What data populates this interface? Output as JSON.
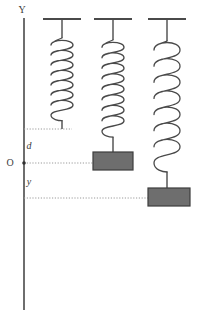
{
  "figure": {
    "background_color": "#ffffff",
    "line_color": "#4a4a4a",
    "block_fill": "#6e6e6e",
    "block_stroke": "#3d3d3d",
    "dotted_color": "#9a9a9a",
    "axis": {
      "name": "vertical-y-axis",
      "label": "Y",
      "label_x": 22,
      "label_y": 13,
      "x": 24,
      "y_top": 18,
      "y_bottom": 310
    },
    "origin": {
      "label": "O",
      "label_x": 10,
      "label_y": 166,
      "dot_x": 24,
      "dot_y": 163
    },
    "markers": [
      {
        "name": "natural-length-line",
        "label": "",
        "y": 129,
        "x_start": 24,
        "x_end": 72
      },
      {
        "name": "equilibrium-line",
        "label": "O",
        "y": 163,
        "x_start": 24,
        "x_end": 122
      },
      {
        "name": "displaced-line",
        "label": "",
        "y": 198,
        "x_start": 24,
        "x_end": 178
      }
    ],
    "distance_labels": [
      {
        "name": "distance-d",
        "text": "d",
        "x": 29,
        "y": 149
      },
      {
        "name": "displacement-y",
        "text": "y",
        "x": 29,
        "y": 185
      }
    ],
    "springs": [
      {
        "name": "spring-unloaded",
        "center_x": 62,
        "ceiling_y": 19,
        "ceiling_half_width": 19,
        "stem_top": 19,
        "coil_top": 42,
        "coil_bottom": 112,
        "coils": 7,
        "coil_radius_x": 11,
        "tail_bottom": 129,
        "has_block": false
      },
      {
        "name": "spring-with-block-at-origin",
        "center_x": 113,
        "ceiling_y": 19,
        "ceiling_half_width": 19,
        "stem_top": 19,
        "coil_top": 44,
        "coil_bottom": 128,
        "coils": 8,
        "coil_radius_x": 11,
        "tail_bottom": 152,
        "has_block": true,
        "block": {
          "name": "mass-block-origin",
          "x": 93,
          "y": 152,
          "width": 40,
          "height": 18
        }
      },
      {
        "name": "spring-with-block-displaced",
        "center_x": 167,
        "ceiling_y": 19,
        "ceiling_half_width": 19,
        "stem_top": 19,
        "coil_top": 45,
        "coil_bottom": 158,
        "coils": 7,
        "coil_radius_x": 13,
        "tail_bottom": 188,
        "has_block": true,
        "block": {
          "name": "mass-block-displaced",
          "x": 148,
          "y": 188,
          "width": 42,
          "height": 18
        }
      }
    ]
  }
}
